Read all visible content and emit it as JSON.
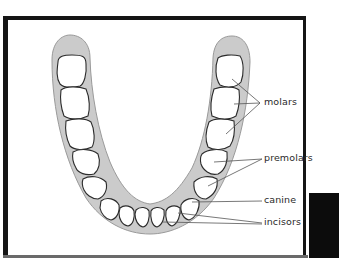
{
  "diagram": {
    "type": "labeled-anatomy-illustration",
    "labels": [
      {
        "id": "molars",
        "text": "molars"
      },
      {
        "id": "premolars",
        "text": "premolars"
      },
      {
        "id": "canine",
        "text": "canine"
      },
      {
        "id": "incisors",
        "text": "incisors"
      }
    ],
    "colors": {
      "frame": "#151515",
      "gum": "#c8c8c8",
      "tooth_fill": "#ffffff",
      "tooth_outline": "#2b2b2b",
      "leader_lines": "#555555",
      "label_text": "#2a2a2a"
    }
  }
}
